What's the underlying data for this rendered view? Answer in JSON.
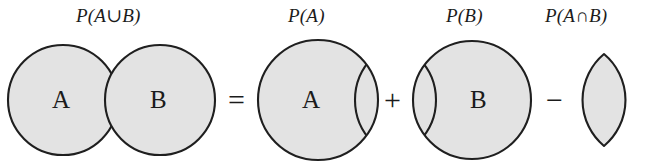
{
  "figure": {
    "equation_text": "P(A∪B) = P(A) + P(B) − P(A∩B)",
    "colors": {
      "fill": "#e3e3e3",
      "stroke": "#1f1f1f",
      "background": "#ffffff",
      "text": "#1b1b1b"
    }
  },
  "terms": [
    {
      "id": "union",
      "prob_label": "P(A∪B)",
      "shape": "two-overlapping-circles",
      "shaded": "both-circles-entire-union",
      "set_labels": [
        "A",
        "B"
      ]
    },
    {
      "id": "a",
      "prob_label": "P(A)",
      "shape": "circle-with-overlap-arc",
      "shaded": "entire-circle",
      "set_labels": [
        "A"
      ]
    },
    {
      "id": "b",
      "prob_label": "P(B)",
      "shape": "circle-with-overlap-arc",
      "shaded": "entire-circle",
      "set_labels": [
        "B"
      ]
    },
    {
      "id": "intersection",
      "prob_label": "P(A∩B)",
      "shape": "lens",
      "shaded": "lens-only",
      "set_labels": []
    }
  ],
  "operators": [
    {
      "id": "equals",
      "symbol": "="
    },
    {
      "id": "plus",
      "symbol": "+"
    },
    {
      "id": "minus",
      "symbol": "−"
    }
  ],
  "set_labels": {
    "union_a": "A",
    "union_b": "B",
    "term_a": "A",
    "term_b": "B"
  }
}
